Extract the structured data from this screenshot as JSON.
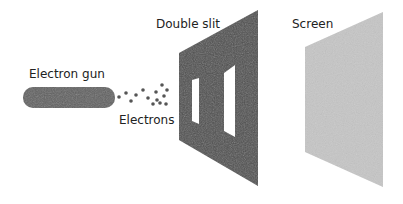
{
  "diagram": {
    "labels": {
      "gun": "Electron gun",
      "electrons": "Electrons",
      "slit": "Double slit",
      "screen": "Screen"
    },
    "colors": {
      "gun": "#606060",
      "electron": "#505050",
      "slit_panel": "#505050",
      "screen": "#c4c4c4",
      "background": "#ffffff"
    }
  }
}
